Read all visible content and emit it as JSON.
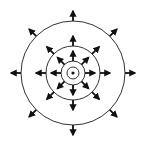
{
  "diagram": {
    "center": [
      73,
      73
    ],
    "stroke_color": "#333333",
    "arrow_color": "#111111",
    "background": "#ffffff",
    "center_dot": {
      "radius": 1.6
    },
    "rings": [
      {
        "name": "innermost-ring",
        "radius": 6
      },
      {
        "name": "inner-ring",
        "radius": 12
      },
      {
        "name": "middle-ring",
        "radius": 27
      },
      {
        "name": "outer-ring",
        "radius": 52
      }
    ],
    "arrow_groups": [
      {
        "name": "inner-arrows",
        "count": 8,
        "start_radius": 12,
        "end_radius": 22,
        "angles_deg": [
          0,
          45,
          90,
          135,
          180,
          225,
          270,
          315
        ]
      },
      {
        "name": "middle-arrows",
        "count": 8,
        "start_radius": 27,
        "end_radius": 37,
        "angles_deg": [
          0,
          45,
          90,
          135,
          180,
          225,
          270,
          315
        ]
      },
      {
        "name": "outer-arrows",
        "count": 8,
        "start_radius": 52,
        "end_radius": 62,
        "angles_deg": [
          0,
          45,
          90,
          135,
          180,
          225,
          270,
          315
        ]
      }
    ]
  }
}
